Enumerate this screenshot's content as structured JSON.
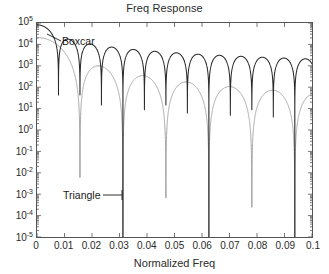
{
  "chart": {
    "title": "Freq Response",
    "xlabel": "Normalized Freq",
    "ylabel": ""
  },
  "axes": {
    "x_ticks": [
      "0",
      "0.01",
      "0.02",
      "0.03",
      "0.04",
      "0.05",
      "0.06",
      "0.07",
      "0.08",
      "0.09",
      "0.1"
    ],
    "y_ticks": [
      "10",
      "10",
      "10",
      "10",
      "10",
      "10",
      "10",
      "10",
      "10",
      "10",
      "10"
    ],
    "y_exponents": [
      "5",
      "4",
      "3",
      "2",
      "1",
      "0",
      "-1",
      "-2",
      "-3",
      "-4",
      "-5"
    ]
  },
  "annotations": {
    "boxcar": "Boxcar",
    "triangle": "Triangle"
  },
  "colors": {
    "boxcar": "#2b2b2b",
    "triangle": "#9a9a9a",
    "axis": "#555555",
    "text": "#2b2b2b",
    "background": "#ffffff"
  },
  "chart_data": {
    "type": "line",
    "title": "Freq Response",
    "xlabel": "Normalized Freq",
    "ylabel": "",
    "xlim": [
      0,
      0.1
    ],
    "ylim": [
      1e-05,
      100000
    ],
    "yscale": "log",
    "xscale": "linear",
    "grid": false,
    "legend": "annotations",
    "xticks": [
      0,
      0.01,
      0.02,
      0.03,
      0.04,
      0.05,
      0.06,
      0.07,
      0.08,
      0.09,
      0.1
    ],
    "yticks": [
      1e-05,
      0.0001,
      0.001,
      0.01,
      0.1,
      1,
      10,
      100,
      1000,
      10000,
      100000
    ],
    "series": [
      {
        "name": "Boxcar",
        "color": "#2b2b2b",
        "window_length": 128,
        "dc_value": 82000,
        "null_spacing": 0.0078,
        "description": "Magnitude of DFT of rectangular (boxcar) window, sinc-like mainlobe with sidelobes decaying as 1/f",
        "nulls": [
          0.0078,
          0.0156,
          0.0234,
          0.0313,
          0.0391,
          0.0469,
          0.0547,
          0.0625,
          0.0703,
          0.0781,
          0.0859,
          0.0938
        ],
        "sidelobe_peaks_x": [
          0.0117,
          0.0195,
          0.0273,
          0.0352,
          0.043,
          0.0508,
          0.0586,
          0.0664,
          0.0742,
          0.082,
          0.0898,
          0.0977
        ],
        "sidelobe_peaks_y": [
          2800,
          1350,
          870,
          640,
          500,
          410,
          345,
          300,
          260,
          235,
          210,
          190
        ]
      },
      {
        "name": "Triangle",
        "color": "#9a9a9a",
        "window_length": 128,
        "dc_value": 21000,
        "null_spacing": 0.0156,
        "description": "Magnitude of DFT of triangular (Bartlett) window, squared sinc with sidelobes decaying as 1/f^2",
        "nulls": [
          0.0156,
          0.0313,
          0.0469,
          0.0625,
          0.0781,
          0.0938
        ],
        "sidelobe_peaks_x": [
          0.0234,
          0.0391,
          0.0547,
          0.0703,
          0.0859
        ],
        "sidelobe_peaks_y": [
          38,
          5.5,
          1.6,
          0.62,
          0.29
        ]
      }
    ]
  }
}
